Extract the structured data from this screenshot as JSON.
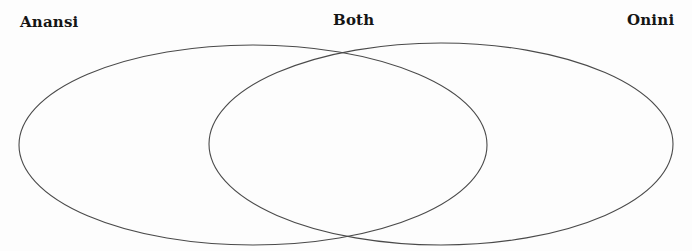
{
  "diagram": {
    "type": "venn",
    "sets": [
      {
        "id": "left",
        "label": "Anansi"
      },
      {
        "id": "both",
        "label": "Both"
      },
      {
        "id": "right",
        "label": "Onini"
      }
    ],
    "stroke_color": "#4a4a4a",
    "label_color": "#151515",
    "background": "#fdfdfd"
  }
}
